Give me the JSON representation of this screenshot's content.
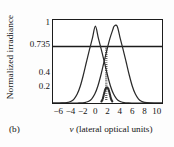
{
  "figure": {
    "panel_label": "(b)",
    "background_color": "#fdfdfd",
    "line_color": "#2a2a2a"
  },
  "chart_data": {
    "type": "line",
    "title": "",
    "subtitle": "",
    "xlabel": "ν (lateral  optical units)",
    "xlabel_symbol": "ν",
    "xlabel_rest": " (lateral  optical units)",
    "ylabel": "Normalized irradiance",
    "xlim": [
      -7,
      11
    ],
    "ylim": [
      0,
      1.08
    ],
    "xticks": [
      -6,
      -4,
      -2,
      0,
      2,
      4,
      6,
      8,
      10
    ],
    "xtick_labels": [
      "−6",
      "−4",
      "−2",
      "0",
      "2",
      "4",
      "6",
      "8",
      "10"
    ],
    "yticks": [
      0.2,
      0.4,
      0.735,
      1
    ],
    "ytick_labels": [
      "0.2",
      "0.4",
      "0.735",
      "1"
    ],
    "grid": false,
    "legend": "none",
    "annotations": [
      {
        "name": "rayleigh-criterion-line",
        "type": "horizontal-line",
        "y": 0.735,
        "label": "0.735",
        "style": "solid"
      }
    ],
    "series": [
      {
        "name": "point-source-1",
        "style": "solid",
        "peak_center": 0.0,
        "peak_value": 1.0,
        "half_width": 1.6,
        "x": [
          -7,
          -6.5,
          -6,
          -5.5,
          -5,
          -4.5,
          -4,
          -3.5,
          -3,
          -2.5,
          -2,
          -1.5,
          -1,
          -0.5,
          0,
          0.5,
          1,
          1.5,
          2,
          2.5,
          3,
          3.5,
          4,
          4.5,
          5,
          5.5,
          6,
          6.5,
          7,
          8,
          9,
          10,
          11
        ],
        "y": [
          0.0,
          0.0,
          0.0,
          0.001,
          0.003,
          0.009,
          0.023,
          0.055,
          0.116,
          0.218,
          0.361,
          0.527,
          0.689,
          0.84,
          1.0,
          0.84,
          0.689,
          0.527,
          0.361,
          0.218,
          0.116,
          0.055,
          0.023,
          0.009,
          0.003,
          0.001,
          0.0,
          0.0,
          0.0,
          0.0,
          0.0,
          0.0,
          0.0
        ]
      },
      {
        "name": "point-source-2",
        "style": "solid",
        "peak_center": 3.6,
        "peak_value": 1.0,
        "half_width": 1.6,
        "x": [
          -7,
          -6,
          -5,
          -4,
          -3,
          -2.6,
          -2.1,
          -1.6,
          -1.1,
          -0.6,
          -0.1,
          0.4,
          0.9,
          1.4,
          1.9,
          2.4,
          2.9,
          3.1,
          3.6,
          4.1,
          4.6,
          5.1,
          5.6,
          6.1,
          6.6,
          7.1,
          7.6,
          8.1,
          9,
          10,
          11
        ],
        "y": [
          0.0,
          0.0,
          0.0,
          0.0,
          0.0,
          0.001,
          0.003,
          0.009,
          0.023,
          0.055,
          0.116,
          0.218,
          0.361,
          0.527,
          0.689,
          0.84,
          0.96,
          1.0,
          1.0,
          0.84,
          0.689,
          0.527,
          0.361,
          0.218,
          0.116,
          0.055,
          0.023,
          0.009,
          0.001,
          0.0,
          0.0
        ]
      },
      {
        "name": "resultant-sum",
        "style": "dotted",
        "x": [
          1.0,
          1.2,
          1.4,
          1.6,
          1.8,
          2.0,
          2.2,
          2.4,
          2.6,
          2.8
        ],
        "y": [
          0.02,
          0.05,
          0.11,
          0.17,
          0.2,
          0.2,
          0.17,
          0.11,
          0.05,
          0.02
        ],
        "central_dip_value": 0.2,
        "central_dip_position": 1.8
      }
    ]
  }
}
